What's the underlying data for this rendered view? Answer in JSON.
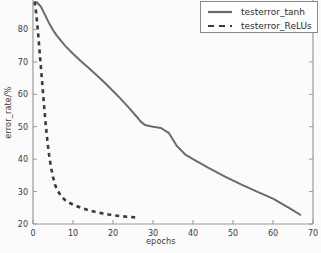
{
  "chart_data": {
    "type": "line",
    "title": "",
    "xlabel": "epochs",
    "ylabel": "error_rate/%",
    "xlim": [
      0,
      70
    ],
    "ylim": [
      20,
      90
    ],
    "xticks": [
      0,
      10,
      20,
      30,
      40,
      50,
      60,
      70
    ],
    "yticks": [
      20,
      30,
      40,
      50,
      60,
      70,
      80,
      90
    ],
    "grid": false,
    "legend_position": "upper right",
    "series": [
      {
        "name": "testerror_tanh",
        "style": "solid",
        "color": "#6b6b6b",
        "x": [
          0.5,
          1,
          2,
          3,
          4,
          5,
          6,
          8,
          10,
          12,
          14,
          16,
          18,
          20,
          22,
          24,
          26,
          27,
          28,
          30,
          32,
          34,
          35,
          36,
          38,
          40,
          44,
          48,
          52,
          56,
          60,
          64,
          67
        ],
        "y": [
          88.5,
          88.3,
          87.0,
          84.5,
          82.0,
          79.8,
          78.0,
          75.0,
          72.5,
          70.2,
          68.0,
          65.8,
          63.5,
          61.0,
          58.5,
          55.8,
          53.0,
          51.5,
          50.5,
          50.0,
          49.6,
          48.0,
          46.0,
          44.0,
          41.5,
          40.0,
          37.2,
          34.6,
          32.2,
          30.0,
          27.8,
          25.0,
          22.7
        ]
      },
      {
        "name": "testerror_ReLUs",
        "style": "dashed",
        "color": "#3a3a3a",
        "x": [
          0.4,
          0.8,
          1.2,
          1.6,
          2.0,
          2.4,
          2.8,
          3.2,
          3.6,
          4.0,
          4.5,
          5.0,
          5.5,
          6.0,
          7.0,
          8.0,
          9.0,
          10.0,
          12.0,
          14.0,
          16.0,
          18.0,
          20.0,
          22.0,
          24.0,
          26.0
        ],
        "y": [
          88.6,
          85.0,
          80.0,
          74.0,
          68.0,
          62.0,
          56.0,
          50.5,
          45.5,
          41.5,
          37.5,
          34.5,
          32.2,
          30.6,
          28.6,
          27.4,
          26.6,
          26.0,
          25.0,
          24.2,
          23.6,
          23.1,
          22.7,
          22.4,
          22.2,
          22.0
        ]
      }
    ]
  },
  "legend": {
    "entries": [
      {
        "label": "testerror_tanh",
        "style": "solid"
      },
      {
        "label": "testerror_ReLUs",
        "style": "dashed"
      }
    ]
  },
  "axes": {
    "xlabel": "epochs",
    "ylabel": "error_rate/%"
  },
  "colors": {
    "tanh_line": "#6b6b6b",
    "relu_line": "#3a3a3a",
    "axis": "#9a9a9a",
    "background": "#fbfbfb"
  }
}
